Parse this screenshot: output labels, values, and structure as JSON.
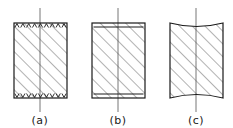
{
  "figure": {
    "background_color": "#ffffff",
    "line_color": "#1a1a1a",
    "hatch_color": "#555555",
    "axis_color": "#777777",
    "panels": [
      {
        "id": "a",
        "caption": "(a)",
        "end_condition": "toothed-friction-ends",
        "block": {
          "x": 14,
          "y": 23,
          "width": 53,
          "height": 75
        },
        "load_line": {
          "x": 40,
          "top": 8,
          "bottom": 112
        },
        "tooth_count": 9,
        "caption_x": 40,
        "caption_y": 124
      },
      {
        "id": "b",
        "caption": "(b)",
        "end_condition": "platen-plate-ends",
        "block": {
          "x": 92,
          "y": 23,
          "width": 53,
          "height": 75
        },
        "load_line": {
          "x": 118,
          "top": 8,
          "bottom": 112
        },
        "plate_inset": 4,
        "caption_x": 118,
        "caption_y": 124
      },
      {
        "id": "c",
        "caption": "(c)",
        "end_condition": "concave-curved-ends",
        "block": {
          "x": 170,
          "y": 23,
          "width": 53,
          "height": 75
        },
        "load_line": {
          "x": 196,
          "top": 8,
          "bottom": 112
        },
        "curve_depth": 7,
        "caption_x": 196,
        "caption_y": 124
      }
    ]
  }
}
